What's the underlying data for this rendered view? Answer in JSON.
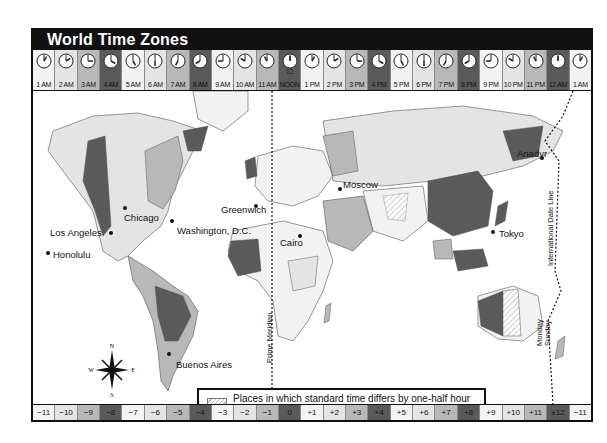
{
  "title": "World Time Zones",
  "clock_row": [
    {
      "label": "1 AM",
      "hour": 1,
      "shade": "#f2f2f2"
    },
    {
      "label": "2 AM",
      "hour": 2,
      "shade": "#e4e4e4"
    },
    {
      "label": "3 AM",
      "hour": 3,
      "shade": "#b8b8b8"
    },
    {
      "label": "4 AM",
      "hour": 4,
      "shade": "#5a5a5a"
    },
    {
      "label": "5 AM",
      "hour": 5,
      "shade": "#f2f2f2"
    },
    {
      "label": "6 AM",
      "hour": 6,
      "shade": "#e4e4e4"
    },
    {
      "label": "7 AM",
      "hour": 7,
      "shade": "#b8b8b8"
    },
    {
      "label": "8 AM",
      "hour": 8,
      "shade": "#5a5a5a"
    },
    {
      "label": "9 AM",
      "hour": 9,
      "shade": "#f2f2f2"
    },
    {
      "label": "10 AM",
      "hour": 10,
      "shade": "#e4e4e4"
    },
    {
      "label": "11 AM",
      "hour": 11,
      "shade": "#b8b8b8"
    },
    {
      "label": "NOON",
      "hour": 12,
      "shade": "#5a5a5a",
      "top": "12"
    },
    {
      "label": "1 PM",
      "hour": 1,
      "shade": "#f2f2f2"
    },
    {
      "label": "2 PM",
      "hour": 2,
      "shade": "#e4e4e4"
    },
    {
      "label": "3 PM",
      "hour": 3,
      "shade": "#b8b8b8"
    },
    {
      "label": "4 PM",
      "hour": 4,
      "shade": "#5a5a5a"
    },
    {
      "label": "5 PM",
      "hour": 5,
      "shade": "#f2f2f2"
    },
    {
      "label": "6 PM",
      "hour": 6,
      "shade": "#e4e4e4"
    },
    {
      "label": "7 PM",
      "hour": 7,
      "shade": "#b8b8b8"
    },
    {
      "label": "8 PM",
      "hour": 8,
      "shade": "#5a5a5a"
    },
    {
      "label": "9 PM",
      "hour": 9,
      "shade": "#f2f2f2"
    },
    {
      "label": "10 PM",
      "hour": 10,
      "shade": "#e4e4e4"
    },
    {
      "label": "11 PM",
      "hour": 11,
      "shade": "#b8b8b8"
    },
    {
      "label": "12 AM",
      "hour": 12,
      "shade": "#5a5a5a"
    },
    {
      "label": "1 AM",
      "hour": 1,
      "shade": "#f2f2f2"
    }
  ],
  "zone_bar": [
    {
      "label": "−11",
      "shade": "#f2f2f2"
    },
    {
      "label": "−10",
      "shade": "#e4e4e4"
    },
    {
      "label": "−9",
      "shade": "#b8b8b8"
    },
    {
      "label": "−8",
      "shade": "#5a5a5a"
    },
    {
      "label": "−7",
      "shade": "#f2f2f2"
    },
    {
      "label": "−6",
      "shade": "#e4e4e4"
    },
    {
      "label": "−5",
      "shade": "#b8b8b8"
    },
    {
      "label": "−4",
      "shade": "#5a5a5a"
    },
    {
      "label": "−3",
      "shade": "#f2f2f2"
    },
    {
      "label": "−2",
      "shade": "#e4e4e4"
    },
    {
      "label": "−1",
      "shade": "#b8b8b8"
    },
    {
      "label": "0",
      "shade": "#5a5a5a"
    },
    {
      "label": "+1",
      "shade": "#f2f2f2"
    },
    {
      "label": "+2",
      "shade": "#e4e4e4"
    },
    {
      "label": "+3",
      "shade": "#b8b8b8"
    },
    {
      "label": "+4",
      "shade": "#5a5a5a"
    },
    {
      "label": "+5",
      "shade": "#f2f2f2"
    },
    {
      "label": "+6",
      "shade": "#e4e4e4"
    },
    {
      "label": "+7",
      "shade": "#b8b8b8"
    },
    {
      "label": "+8",
      "shade": "#5a5a5a"
    },
    {
      "label": "+9",
      "shade": "#f2f2f2"
    },
    {
      "label": "+10",
      "shade": "#e4e4e4"
    },
    {
      "label": "+11",
      "shade": "#b8b8b8"
    },
    {
      "label": "±12",
      "shade": "#5a5a5a"
    },
    {
      "label": "−11",
      "shade": "#f2f2f2"
    }
  ],
  "cities": [
    {
      "name": "Chicago",
      "x": 91,
      "y": 121,
      "dx": 92,
      "dy": 117
    },
    {
      "name": "Los Angeles",
      "x": 17,
      "y": 136,
      "dx": 78,
      "dy": 142
    },
    {
      "name": "Washington, D.C.",
      "x": 144,
      "y": 134,
      "dx": 139,
      "dy": 130
    },
    {
      "name": "Honolulu",
      "x": 20,
      "y": 158,
      "dx": 15,
      "dy": 162
    },
    {
      "name": "Greenwich",
      "x": 188,
      "y": 113,
      "dx": 223,
      "dy": 115
    },
    {
      "name": "Moscow",
      "x": 310,
      "y": 88,
      "dx": 307,
      "dy": 98
    },
    {
      "name": "Cairo",
      "x": 247,
      "y": 146,
      "dx": 267,
      "dy": 145
    },
    {
      "name": "Anadyr",
      "x": 484,
      "y": 57,
      "dx": 509,
      "dy": 67
    },
    {
      "name": "Tokyo",
      "x": 466,
      "y": 137,
      "dx": 460,
      "dy": 141
    },
    {
      "name": "Buenos Aires",
      "x": 143,
      "y": 268,
      "dx": 136,
      "dy": 263
    }
  ],
  "line_labels": {
    "prime_meridian": "Prime Meridian",
    "date_line": "International Date Line",
    "monday": "Monday",
    "sunday": "Sunday"
  },
  "compass": {
    "n": "N",
    "s": "S",
    "e": "E",
    "w": "W"
  },
  "legend": {
    "line1": "Places in which standard time differs by one-half hour",
    "line2": "or in which a zone system has not been adopted."
  }
}
